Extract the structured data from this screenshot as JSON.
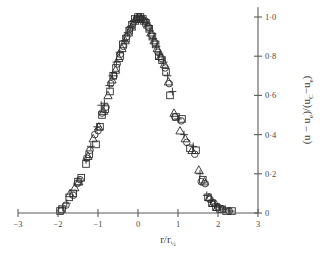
{
  "chart_data": {
    "type": "scatter",
    "title": "",
    "xlabel": "r/r½",
    "xlabel_base": "r/r",
    "xlabel_sub": "½",
    "ylabel": "(u − u_e)/(u_C − u_e)",
    "ylabel_parts": {
      "open1": "(u − u",
      "sub1": "e",
      "mid": ")/(u",
      "sub2": "C",
      "minus": "−u",
      "sub3": "e",
      "close": ")"
    },
    "xlim": [
      -3,
      3
    ],
    "ylim": [
      0,
      1.05
    ],
    "xticks": [
      -3,
      -2,
      -1,
      0,
      1,
      2,
      3
    ],
    "xticklabels": [
      "−3",
      "−2",
      "−1",
      "0",
      "1",
      "2",
      "3"
    ],
    "yticks": [
      0,
      0.2,
      0.4,
      0.6,
      0.8,
      1.0
    ],
    "yticklabels": [
      "0",
      "0·2",
      "0·4",
      "0·6",
      "0·8",
      "1·0"
    ],
    "grid": false,
    "legend": "none",
    "y_axis_position": "right",
    "x_axis_position": "zero",
    "series": [
      {
        "name": "square",
        "marker": "square",
        "points": [
          [
            -1.95,
            0.01
          ],
          [
            -1.9,
            0.02
          ],
          [
            -1.72,
            0.08
          ],
          [
            -1.62,
            0.1
          ],
          [
            -1.5,
            0.16
          ],
          [
            -1.42,
            0.18
          ],
          [
            -1.3,
            0.25
          ],
          [
            -1.22,
            0.3
          ],
          [
            -1.05,
            0.35
          ],
          [
            -0.95,
            0.44
          ],
          [
            -0.9,
            0.5
          ],
          [
            -0.82,
            0.53
          ],
          [
            -0.7,
            0.62
          ],
          [
            -0.62,
            0.7
          ],
          [
            -0.55,
            0.74
          ],
          [
            -0.45,
            0.8
          ],
          [
            -0.38,
            0.86
          ],
          [
            -0.3,
            0.89
          ],
          [
            -0.22,
            0.93
          ],
          [
            -0.15,
            0.96
          ],
          [
            -0.08,
            0.99
          ],
          [
            0.0,
            1.0
          ],
          [
            0.06,
            1.0
          ],
          [
            0.12,
            0.99
          ],
          [
            0.2,
            0.97
          ],
          [
            0.28,
            0.94
          ],
          [
            0.36,
            0.9
          ],
          [
            0.44,
            0.86
          ],
          [
            0.52,
            0.8
          ],
          [
            0.6,
            0.78
          ],
          [
            0.7,
            0.72
          ],
          [
            0.8,
            0.6
          ],
          [
            0.95,
            0.49
          ],
          [
            1.1,
            0.48
          ],
          [
            1.3,
            0.33
          ],
          [
            1.45,
            0.32
          ],
          [
            1.62,
            0.17
          ],
          [
            1.75,
            0.08
          ],
          [
            1.85,
            0.05
          ],
          [
            1.95,
            0.03
          ],
          [
            2.05,
            0.02
          ],
          [
            2.2,
            0.01
          ],
          [
            2.35,
            0.01
          ]
        ]
      },
      {
        "name": "circle",
        "marker": "circle",
        "points": [
          [
            -1.92,
            0.01
          ],
          [
            -1.8,
            0.04
          ],
          [
            -1.62,
            0.09
          ],
          [
            -1.52,
            0.15
          ],
          [
            -1.45,
            0.17
          ],
          [
            -1.28,
            0.28
          ],
          [
            -1.2,
            0.32
          ],
          [
            -1.08,
            0.4
          ],
          [
            -1.0,
            0.42
          ],
          [
            -0.9,
            0.51
          ],
          [
            -0.8,
            0.54
          ],
          [
            -0.68,
            0.66
          ],
          [
            -0.6,
            0.7
          ],
          [
            -0.52,
            0.76
          ],
          [
            -0.44,
            0.81
          ],
          [
            -0.36,
            0.85
          ],
          [
            -0.28,
            0.9
          ],
          [
            -0.2,
            0.94
          ],
          [
            -0.12,
            0.97
          ],
          [
            -0.04,
            0.99
          ],
          [
            0.03,
            1.0
          ],
          [
            0.1,
            0.99
          ],
          [
            0.18,
            0.98
          ],
          [
            0.26,
            0.95
          ],
          [
            0.34,
            0.91
          ],
          [
            0.42,
            0.87
          ],
          [
            0.5,
            0.82
          ],
          [
            0.58,
            0.79
          ],
          [
            0.68,
            0.74
          ],
          [
            0.78,
            0.66
          ],
          [
            0.92,
            0.49
          ],
          [
            1.08,
            0.47
          ],
          [
            1.22,
            0.36
          ],
          [
            1.42,
            0.3
          ],
          [
            1.58,
            0.16
          ],
          [
            1.68,
            0.15
          ],
          [
            1.8,
            0.07
          ],
          [
            1.9,
            0.05
          ],
          [
            2.0,
            0.03
          ],
          [
            2.12,
            0.02
          ],
          [
            2.28,
            0.01
          ]
        ]
      },
      {
        "name": "triangle",
        "marker": "triangle",
        "points": [
          [
            -1.7,
            0.1
          ],
          [
            -1.58,
            0.13
          ],
          [
            -1.48,
            0.16
          ],
          [
            -1.25,
            0.29
          ],
          [
            -1.12,
            0.38
          ],
          [
            -0.98,
            0.44
          ],
          [
            -0.86,
            0.52
          ],
          [
            -0.75,
            0.6
          ],
          [
            -0.65,
            0.68
          ],
          [
            -0.56,
            0.73
          ],
          [
            -0.48,
            0.79
          ],
          [
            -0.4,
            0.84
          ],
          [
            -0.32,
            0.88
          ],
          [
            -0.24,
            0.92
          ],
          [
            -0.16,
            0.95
          ],
          [
            -0.08,
            0.98
          ],
          [
            0.0,
            0.99
          ],
          [
            0.08,
            0.99
          ],
          [
            0.16,
            0.98
          ],
          [
            0.24,
            0.96
          ],
          [
            0.32,
            0.92
          ],
          [
            0.4,
            0.88
          ],
          [
            0.48,
            0.84
          ],
          [
            0.56,
            0.8
          ],
          [
            0.66,
            0.76
          ],
          [
            0.76,
            0.67
          ],
          [
            0.9,
            0.51
          ],
          [
            1.05,
            0.42
          ],
          [
            1.18,
            0.38
          ],
          [
            1.35,
            0.32
          ],
          [
            1.52,
            0.22
          ],
          [
            1.66,
            0.16
          ],
          [
            1.78,
            0.08
          ],
          [
            1.88,
            0.05
          ],
          [
            1.98,
            0.03
          ],
          [
            2.1,
            0.02
          ]
        ]
      },
      {
        "name": "plus",
        "marker": "plus",
        "points": [
          [
            -1.88,
            0.03
          ],
          [
            -1.78,
            0.05
          ],
          [
            -1.3,
            0.27
          ],
          [
            -1.18,
            0.34
          ],
          [
            -1.02,
            0.44
          ],
          [
            -0.92,
            0.55
          ],
          [
            -0.84,
            0.56
          ],
          [
            -0.72,
            0.65
          ],
          [
            -0.64,
            0.7
          ],
          [
            -0.54,
            0.77
          ],
          [
            -0.46,
            0.82
          ],
          [
            -0.34,
            0.88
          ],
          [
            -0.26,
            0.92
          ],
          [
            -0.18,
            0.95
          ],
          [
            -0.1,
            0.98
          ],
          [
            -0.02,
            1.0
          ],
          [
            0.05,
            1.0
          ],
          [
            0.14,
            0.99
          ],
          [
            0.22,
            0.97
          ],
          [
            0.3,
            0.93
          ],
          [
            0.38,
            0.89
          ],
          [
            0.46,
            0.85
          ],
          [
            0.54,
            0.81
          ],
          [
            0.64,
            0.77
          ],
          [
            0.74,
            0.7
          ],
          [
            0.86,
            0.62
          ],
          [
            1.0,
            0.48
          ],
          [
            1.15,
            0.4
          ],
          [
            1.38,
            0.34
          ],
          [
            1.55,
            0.2
          ],
          [
            1.72,
            0.09
          ],
          [
            1.82,
            0.06
          ],
          [
            1.92,
            0.04
          ],
          [
            2.02,
            0.03
          ],
          [
            2.18,
            0.02
          ],
          [
            2.32,
            0.01
          ]
        ]
      }
    ]
  },
  "style": {
    "axis_color": "#5b5b5b",
    "marker_color": "#2e2e2e",
    "text_color": "#3d3d3d",
    "background": "#ffffff"
  }
}
